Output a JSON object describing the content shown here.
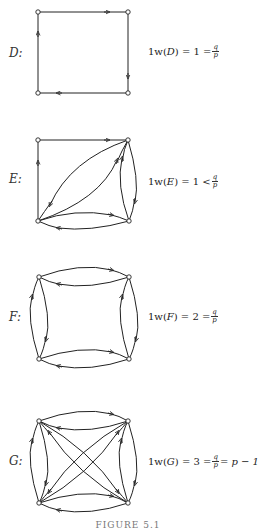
{
  "figures": [
    {
      "id": "D",
      "label": "D:",
      "formula": {
        "prefix": "1w(",
        "name": "D",
        "suffix": ") = 1 = ",
        "frac_num": "q",
        "frac_den": "p",
        "tail": ""
      },
      "nodes": [
        [
          38,
          12
        ],
        [
          128,
          12
        ],
        [
          38,
          93
        ],
        [
          128,
          93
        ]
      ],
      "edges": "directed 4-cycle: TL→TR, TR→BR, BR→BL, BL→TL"
    },
    {
      "id": "E",
      "label": "E:",
      "formula": {
        "prefix": "1w(",
        "name": "E",
        "suffix": ") = 1 < ",
        "frac_num": "q",
        "frac_den": "p",
        "tail": ""
      },
      "nodes": [
        [
          38,
          140
        ],
        [
          128,
          140
        ],
        [
          38,
          221
        ],
        [
          129,
          221
        ]
      ],
      "edges": "TL→TR, BL→TL, BL⇄TR (two arcs), TR⇄BR (two arcs), BL⇄BR (two arcs)"
    },
    {
      "id": "F",
      "label": "F:",
      "formula": {
        "prefix": "1w(",
        "name": "F",
        "suffix": ") = 2 = ",
        "frac_num": "q",
        "frac_den": "p",
        "tail": ""
      },
      "nodes": [
        [
          39,
          277
        ],
        [
          129,
          277
        ],
        [
          39,
          359
        ],
        [
          129,
          359
        ]
      ],
      "edges": "each side a pair of opposite arcs"
    },
    {
      "id": "G",
      "label": "G:",
      "formula": {
        "prefix": "1w(",
        "name": "G",
        "suffix": ") = 3 = ",
        "frac_num": "q",
        "frac_den": "p",
        "tail": " = p − 1"
      },
      "nodes": [
        [
          39,
          421
        ],
        [
          128,
          421
        ],
        [
          39,
          503
        ],
        [
          128,
          503
        ]
      ],
      "edges": "complete symmetric digraph on 4 vertices"
    }
  ],
  "caption": "FIGURE 5.1"
}
